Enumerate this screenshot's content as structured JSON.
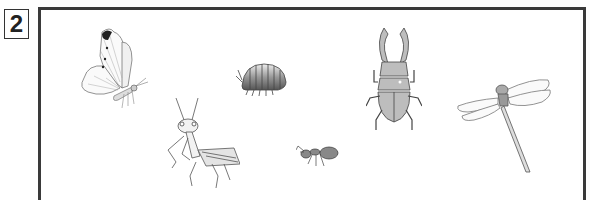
{
  "question": {
    "number": "2"
  },
  "illustrations": [
    {
      "id": "butterfly",
      "label": "butterfly"
    },
    {
      "id": "pill-bug",
      "label": "pill bug"
    },
    {
      "id": "stag-beetle",
      "label": "stag beetle"
    },
    {
      "id": "dragonfly",
      "label": "dragonfly"
    },
    {
      "id": "praying-mantis",
      "label": "praying mantis"
    },
    {
      "id": "ant",
      "label": "ant"
    }
  ]
}
